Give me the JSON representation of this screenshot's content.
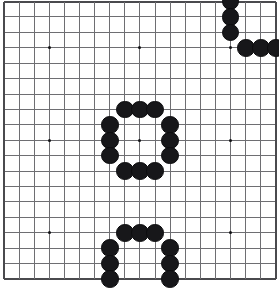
{
  "board": {
    "title": "Go board position",
    "type": "go-goban",
    "size": 19,
    "columns": 19,
    "rows": 19,
    "geometry": {
      "origin_x": 4.0,
      "origin_y": 1.5,
      "cell_w": 15.11,
      "cell_h": 15.42,
      "stone_diameter": 17.5,
      "star_dot_size": 3
    },
    "colors": {
      "background": "#ffffff",
      "grid_line": "#6e6e72",
      "border_line": "#4a4a4e",
      "star_point": "#111114",
      "black_stone": "#17171a",
      "black_stone_edge": "#0c0c0e",
      "white_stone": "#fbfbfb",
      "white_stone_edge": "#2b2b2e"
    },
    "star_points": [
      {
        "col": 3,
        "row": 3
      },
      {
        "col": 9,
        "row": 3
      },
      {
        "col": 15,
        "row": 3
      },
      {
        "col": 3,
        "row": 9
      },
      {
        "col": 9,
        "row": 9
      },
      {
        "col": 15,
        "row": 9
      },
      {
        "col": 3,
        "row": 15
      },
      {
        "col": 9,
        "row": 15
      },
      {
        "col": 15,
        "row": 15
      }
    ],
    "stones": [
      {
        "col": 15,
        "row": 0,
        "color": "black"
      },
      {
        "col": 15,
        "row": 1,
        "color": "black"
      },
      {
        "col": 15,
        "row": 2,
        "color": "black"
      },
      {
        "col": 16,
        "row": 3,
        "color": "black"
      },
      {
        "col": 17,
        "row": 3,
        "color": "black"
      },
      {
        "col": 18,
        "row": 3,
        "color": "black"
      },
      {
        "col": 8,
        "row": 7,
        "color": "black"
      },
      {
        "col": 9,
        "row": 7,
        "color": "black"
      },
      {
        "col": 10,
        "row": 7,
        "color": "black"
      },
      {
        "col": 7,
        "row": 8,
        "color": "black"
      },
      {
        "col": 11,
        "row": 8,
        "color": "black"
      },
      {
        "col": 7,
        "row": 9,
        "color": "black"
      },
      {
        "col": 11,
        "row": 9,
        "color": "black"
      },
      {
        "col": 7,
        "row": 10,
        "color": "black"
      },
      {
        "col": 11,
        "row": 10,
        "color": "black"
      },
      {
        "col": 8,
        "row": 11,
        "color": "black"
      },
      {
        "col": 9,
        "row": 11,
        "color": "black"
      },
      {
        "col": 10,
        "row": 11,
        "color": "black"
      },
      {
        "col": 8,
        "row": 15,
        "color": "black"
      },
      {
        "col": 9,
        "row": 15,
        "color": "black"
      },
      {
        "col": 10,
        "row": 15,
        "color": "black"
      },
      {
        "col": 7,
        "row": 16,
        "color": "black"
      },
      {
        "col": 11,
        "row": 16,
        "color": "black"
      },
      {
        "col": 7,
        "row": 17,
        "color": "black"
      },
      {
        "col": 11,
        "row": 17,
        "color": "black"
      },
      {
        "col": 7,
        "row": 18,
        "color": "black"
      },
      {
        "col": 11,
        "row": 18,
        "color": "black"
      }
    ],
    "stone_counts": {
      "black": 27,
      "white": 0
    }
  }
}
